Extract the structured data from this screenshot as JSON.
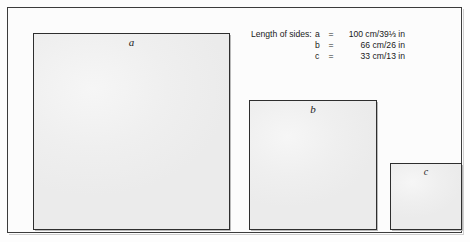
{
  "figure": {
    "legend": {
      "intro": "Length of sides:",
      "rows": [
        {
          "var": "a",
          "eq": "=",
          "value": "100 cm/39⅓ in"
        },
        {
          "var": "b",
          "eq": "=",
          "value": "66 cm/26 in"
        },
        {
          "var": "c",
          "eq": "=",
          "value": "33 cm/13 in"
        }
      ]
    },
    "squares": [
      {
        "label": "a",
        "name": "square-a"
      },
      {
        "label": "b",
        "name": "square-b"
      },
      {
        "label": "c",
        "name": "square-c"
      }
    ],
    "colors": {
      "frame_border": "#3c3c3c",
      "square_border": "#2e2e2e",
      "square_fill": "#efefef",
      "text": "#1a1a1a",
      "page_background": "#fdfdfd"
    }
  }
}
